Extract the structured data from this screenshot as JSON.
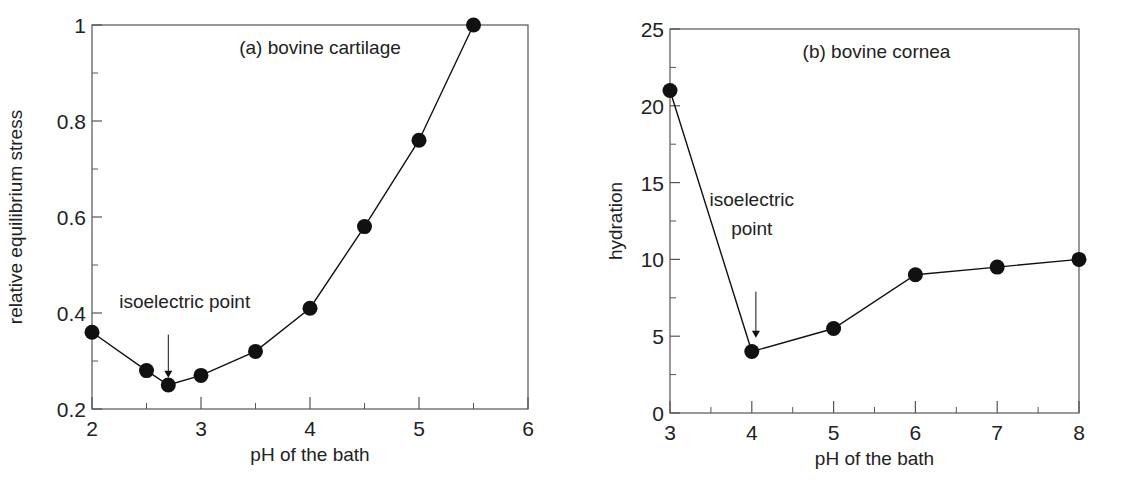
{
  "figure": {
    "background": "#ffffff",
    "ink_color": "#111111",
    "axis_color": "#555555"
  },
  "chart_data": [
    {
      "type": "line",
      "title": "(a) bovine cartilage",
      "xlabel": "pH of the bath",
      "ylabel": "relative equilibrium stress",
      "xlim": [
        2,
        6
      ],
      "ylim": [
        0.2,
        1.0
      ],
      "xticks": [
        2,
        3,
        4,
        5,
        6
      ],
      "xtick_labels": [
        "2",
        "3",
        "4",
        "5",
        "6"
      ],
      "xminor": [
        2.5,
        3.5,
        4.5,
        5.5
      ],
      "yticks": [
        0.2,
        0.4,
        0.6,
        0.8,
        1.0
      ],
      "ytick_labels": [
        "0.2",
        "0.4",
        "0.6",
        "0.8",
        "1"
      ],
      "yminor": [
        0.3,
        0.5,
        0.7,
        0.9
      ],
      "grid": false,
      "markers": "filled-circle",
      "series": [
        {
          "name": "bovine cartilage",
          "x": [
            2.0,
            2.5,
            2.7,
            3.0,
            3.5,
            4.0,
            4.5,
            5.0,
            5.5
          ],
          "values": [
            0.36,
            0.28,
            0.25,
            0.27,
            0.32,
            0.41,
            0.58,
            0.76,
            1.0
          ]
        }
      ],
      "annotations": [
        {
          "text": "isoelectric point",
          "lines": [
            "isoelectric point"
          ],
          "arrow_x": 2.7,
          "arrow_from_y": 0.355,
          "arrow_to_y": 0.265,
          "text_x": 2.25,
          "text_y": 0.41
        }
      ],
      "box": {
        "left": 92,
        "right": 528,
        "top": 25,
        "bottom": 409
      }
    },
    {
      "type": "line",
      "title": "(b) bovine cornea",
      "xlabel": "pH of the bath",
      "ylabel": "hydration",
      "xlim": [
        3,
        8
      ],
      "ylim": [
        0,
        25
      ],
      "xticks": [
        3,
        4,
        5,
        6,
        7,
        8
      ],
      "xtick_labels": [
        "3",
        "4",
        "5",
        "6",
        "7",
        "8"
      ],
      "xminor": [
        3.5,
        4.5,
        5.5,
        6.5,
        7.5
      ],
      "yticks": [
        0,
        5,
        10,
        15,
        20,
        25
      ],
      "ytick_labels": [
        "0",
        "5",
        "10",
        "15",
        "20",
        "25"
      ],
      "yminor": [
        2.5,
        7.5,
        12.5,
        17.5,
        22.5
      ],
      "grid": false,
      "markers": "filled-circle",
      "series": [
        {
          "name": "bovine cornea",
          "x": [
            3,
            4,
            5,
            6,
            7,
            8
          ],
          "values": [
            21,
            4,
            5.5,
            9,
            9.5,
            10
          ]
        }
      ],
      "annotations": [
        {
          "text": "isoelectric point",
          "lines": [
            "isoelectric",
            "point"
          ],
          "arrow_x": 4.05,
          "arrow_from_y": 7.9,
          "arrow_to_y": 4.9,
          "text_x": 4.0,
          "text_y": 13.5
        }
      ],
      "box": {
        "left": 670,
        "right": 1079,
        "top": 29,
        "bottom": 413
      }
    }
  ]
}
